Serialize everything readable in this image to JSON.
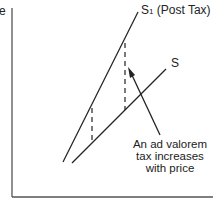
{
  "diagram": {
    "axis_label_y_partial": "e",
    "curves": {
      "s1_label": "S",
      "s1_subscript": "1",
      "s1_suffix": " (Post Tax)",
      "s_label": "S"
    },
    "annotation": {
      "line1": "An ad valorem",
      "line2": "tax increases",
      "line3": "with price"
    },
    "colors": {
      "line": "#222222",
      "axis": "#555555"
    }
  }
}
